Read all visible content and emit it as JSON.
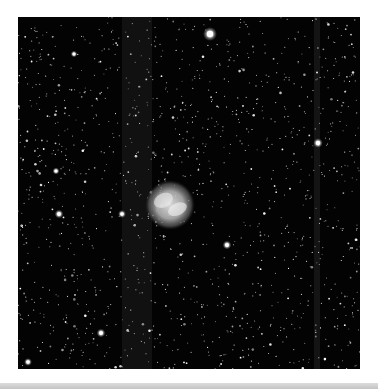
{
  "image": {
    "subject": "Planetary nebula in a dense star field (grayscale astronomical image)",
    "background_color": "#030303",
    "page_background": "#ffffff",
    "bottom_band_color": "#c8c8c8",
    "frame": {
      "x": 18,
      "y": 17,
      "width": 342,
      "height": 352
    }
  },
  "nebula": {
    "cx": 152,
    "cy": 188,
    "r": 22,
    "color": "#d8d8d8"
  },
  "column_bands": [
    {
      "x": 104,
      "width": 30,
      "opacity": 0.06
    },
    {
      "x": 296,
      "width": 6,
      "opacity": 0.07
    }
  ],
  "bright_stars": [
    {
      "x": 192,
      "y": 17,
      "r": 3.2
    },
    {
      "x": 300,
      "y": 126,
      "r": 2.2
    },
    {
      "x": 41,
      "y": 197,
      "r": 2.0
    },
    {
      "x": 104,
      "y": 197,
      "r": 1.8
    },
    {
      "x": 83,
      "y": 316,
      "r": 2.0
    },
    {
      "x": 10,
      "y": 345,
      "r": 1.8
    },
    {
      "x": 209,
      "y": 228,
      "r": 2.0
    },
    {
      "x": 38,
      "y": 154,
      "r": 1.6
    },
    {
      "x": 56,
      "y": 37,
      "r": 1.5
    }
  ],
  "starfield": {
    "count": 1400,
    "seed": 27
  }
}
